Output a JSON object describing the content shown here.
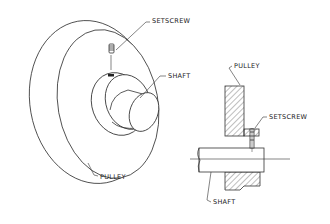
{
  "diagram": {
    "title": "",
    "left_view": {
      "description": "isometric pulley on shaft with setscrew",
      "labels": {
        "setscrew": "SETSCREW",
        "shaft": "SHAFT",
        "pulley": "PULLEY"
      }
    },
    "right_view": {
      "description": "sectional view of pulley hub on shaft with setscrew",
      "labels": {
        "pulley": "PULLEY",
        "setscrew": "SETSCREW",
        "shaft": "SHAFT"
      }
    },
    "colors": {
      "line": "#333333",
      "background": "#ffffff"
    }
  }
}
